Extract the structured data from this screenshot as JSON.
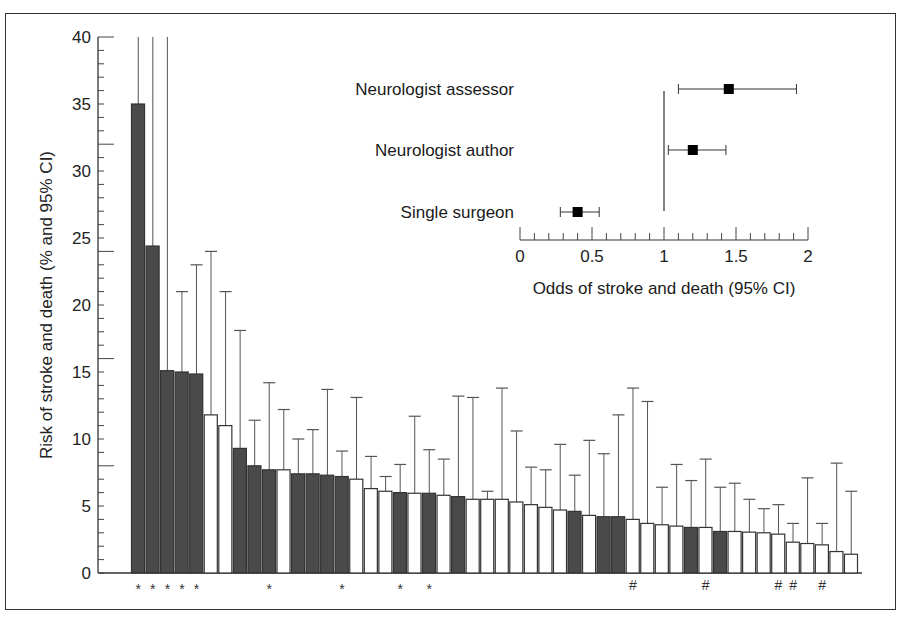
{
  "chart_data": [
    {
      "type": "bar",
      "title": "",
      "xlabel": "",
      "ylabel": "Risk of stroke and death (% and 95% CI)",
      "ylim": [
        0,
        40
      ],
      "yticks": [
        0,
        5,
        10,
        15,
        20,
        25,
        30,
        35,
        40
      ],
      "grid": false,
      "legend": null,
      "colors": {
        "dark": "#4a4a4a",
        "light": "#ffffff",
        "edge": "#333333"
      },
      "bars": [
        {
          "value": 35.0,
          "upper": 40,
          "shaded": true,
          "marker": "*"
        },
        {
          "value": 24.4,
          "upper": 40,
          "shaded": true,
          "marker": "*"
        },
        {
          "value": 15.1,
          "upper": 40,
          "shaded": true,
          "marker": "*"
        },
        {
          "value": 15.0,
          "upper": 21.0,
          "shaded": true,
          "marker": "*"
        },
        {
          "value": 14.85,
          "upper": 23.0,
          "shaded": true,
          "marker": "*"
        },
        {
          "value": 11.8,
          "upper": 24.0,
          "shaded": false,
          "marker": ""
        },
        {
          "value": 11.0,
          "upper": 21.0,
          "shaded": false,
          "marker": ""
        },
        {
          "value": 9.3,
          "upper": 18.1,
          "shaded": true,
          "marker": ""
        },
        {
          "value": 8.0,
          "upper": 11.4,
          "shaded": true,
          "marker": ""
        },
        {
          "value": 7.7,
          "upper": 14.2,
          "shaded": true,
          "marker": "*"
        },
        {
          "value": 7.7,
          "upper": 12.2,
          "shaded": false,
          "marker": ""
        },
        {
          "value": 7.4,
          "upper": 10.0,
          "shaded": true,
          "marker": ""
        },
        {
          "value": 7.4,
          "upper": 10.7,
          "shaded": true,
          "marker": ""
        },
        {
          "value": 7.3,
          "upper": 13.7,
          "shaded": true,
          "marker": ""
        },
        {
          "value": 7.2,
          "upper": 9.1,
          "shaded": true,
          "marker": "*"
        },
        {
          "value": 7.0,
          "upper": 13.1,
          "shaded": false,
          "marker": ""
        },
        {
          "value": 6.3,
          "upper": 8.7,
          "shaded": false,
          "marker": ""
        },
        {
          "value": 6.1,
          "upper": 7.2,
          "shaded": false,
          "marker": ""
        },
        {
          "value": 6.0,
          "upper": 8.1,
          "shaded": true,
          "marker": "*"
        },
        {
          "value": 5.95,
          "upper": 11.7,
          "shaded": false,
          "marker": ""
        },
        {
          "value": 5.95,
          "upper": 9.2,
          "shaded": true,
          "marker": "*"
        },
        {
          "value": 5.8,
          "upper": 8.5,
          "shaded": false,
          "marker": ""
        },
        {
          "value": 5.7,
          "upper": 13.2,
          "shaded": true,
          "marker": ""
        },
        {
          "value": 5.5,
          "upper": 13.1,
          "shaded": false,
          "marker": ""
        },
        {
          "value": 5.5,
          "upper": 6.1,
          "shaded": false,
          "marker": ""
        },
        {
          "value": 5.5,
          "upper": 13.8,
          "shaded": false,
          "marker": ""
        },
        {
          "value": 5.3,
          "upper": 10.6,
          "shaded": false,
          "marker": ""
        },
        {
          "value": 5.1,
          "upper": 7.9,
          "shaded": false,
          "marker": ""
        },
        {
          "value": 4.9,
          "upper": 7.7,
          "shaded": false,
          "marker": ""
        },
        {
          "value": 4.7,
          "upper": 9.6,
          "shaded": false,
          "marker": ""
        },
        {
          "value": 4.6,
          "upper": 7.3,
          "shaded": true,
          "marker": ""
        },
        {
          "value": 4.3,
          "upper": 9.9,
          "shaded": false,
          "marker": ""
        },
        {
          "value": 4.2,
          "upper": 8.9,
          "shaded": true,
          "marker": ""
        },
        {
          "value": 4.2,
          "upper": 11.8,
          "shaded": true,
          "marker": ""
        },
        {
          "value": 4.0,
          "upper": 13.8,
          "shaded": false,
          "marker": "#"
        },
        {
          "value": 3.7,
          "upper": 12.8,
          "shaded": false,
          "marker": ""
        },
        {
          "value": 3.6,
          "upper": 6.4,
          "shaded": false,
          "marker": ""
        },
        {
          "value": 3.5,
          "upper": 8.1,
          "shaded": false,
          "marker": ""
        },
        {
          "value": 3.4,
          "upper": 6.9,
          "shaded": true,
          "marker": ""
        },
        {
          "value": 3.4,
          "upper": 8.5,
          "shaded": false,
          "marker": "#"
        },
        {
          "value": 3.1,
          "upper": 6.4,
          "shaded": true,
          "marker": ""
        },
        {
          "value": 3.1,
          "upper": 6.7,
          "shaded": false,
          "marker": ""
        },
        {
          "value": 3.05,
          "upper": 5.5,
          "shaded": false,
          "marker": ""
        },
        {
          "value": 3.0,
          "upper": 4.8,
          "shaded": false,
          "marker": ""
        },
        {
          "value": 2.9,
          "upper": 5.1,
          "shaded": false,
          "marker": "#"
        },
        {
          "value": 2.3,
          "upper": 3.7,
          "shaded": false,
          "marker": "#"
        },
        {
          "value": 2.2,
          "upper": 7.1,
          "shaded": false,
          "marker": ""
        },
        {
          "value": 2.1,
          "upper": 3.7,
          "shaded": false,
          "marker": "#"
        },
        {
          "value": 1.6,
          "upper": 8.2,
          "shaded": false,
          "marker": ""
        },
        {
          "value": 1.4,
          "upper": 6.1,
          "shaded": false,
          "marker": ""
        }
      ]
    },
    {
      "type": "scatter",
      "subtype": "forest_plot",
      "title": "",
      "xlabel": "Odds of stroke and death (95% CI)",
      "ylabel": "",
      "xlim": [
        0,
        2
      ],
      "xticks": [
        0,
        0.5,
        1,
        1.5,
        2
      ],
      "xtick_labels": [
        "0",
        "0.5",
        "1",
        "1.5",
        "2"
      ],
      "minor_tick_step": 0.1,
      "reference_line": 1,
      "rows": [
        {
          "label": "Neurologist assessor",
          "estimate": 1.45,
          "lower": 1.1,
          "upper": 1.92
        },
        {
          "label": "Neurologist author",
          "estimate": 1.2,
          "lower": 1.03,
          "upper": 1.43
        },
        {
          "label": "Single surgeon",
          "estimate": 0.4,
          "lower": 0.28,
          "upper": 0.55
        }
      ]
    }
  ]
}
